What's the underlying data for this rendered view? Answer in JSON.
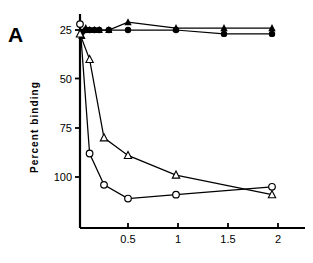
{
  "panel": {
    "letter": "A"
  },
  "axes": {
    "ylabel": "Percent  binding",
    "y_ticks": [
      "100",
      "75",
      "50",
      "25"
    ],
    "x_ticks": [
      "0.5",
      "1",
      "1.5",
      "2"
    ]
  },
  "chart_data": {
    "type": "line",
    "title": "",
    "xlabel": "",
    "ylabel": "Percent  binding",
    "xlim": [
      0,
      2.2
    ],
    "ylim": [
      0,
      107
    ],
    "y_ticks": [
      25,
      50,
      75,
      100
    ],
    "x_ticks": [
      0.5,
      1,
      1.5,
      2
    ],
    "grid": false,
    "legend": "none",
    "series": [
      {
        "name": "filled-circles",
        "marker": "filled-circle",
        "x": [
          0.02,
          0.06,
          0.1,
          0.15,
          0.2,
          0.3,
          0.5,
          1.0,
          1.5,
          2.0
        ],
        "y": [
          99,
          100,
          100,
          100,
          100,
          100,
          100,
          100,
          98,
          98
        ]
      },
      {
        "name": "filled-triangles",
        "marker": "filled-triangle",
        "x": [
          0.02,
          0.06,
          0.1,
          0.15,
          0.2,
          0.3,
          0.5,
          1.0,
          1.5,
          2.0
        ],
        "y": [
          97,
          101,
          100,
          100,
          100,
          100,
          104,
          101,
          101,
          101
        ]
      },
      {
        "name": "open-circles",
        "marker": "open-circle",
        "x": [
          0.0,
          0.1,
          0.25,
          0.5,
          1.0,
          2.0
        ],
        "y": [
          103,
          37,
          21,
          14,
          16,
          20
        ]
      },
      {
        "name": "open-triangles",
        "marker": "open-triangle",
        "x": [
          0.0,
          0.1,
          0.25,
          0.5,
          1.0,
          2.0
        ],
        "y": [
          98,
          85,
          45,
          36,
          26,
          16
        ]
      }
    ]
  }
}
